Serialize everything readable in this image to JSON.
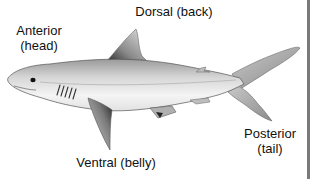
{
  "diagram": {
    "labels": {
      "anterior": {
        "term": "Anterior",
        "descriptor": "(head)"
      },
      "dorsal": {
        "term": "Dorsal",
        "descriptor": "(back)",
        "full": "Dorsal (back)"
      },
      "ventral": {
        "term": "Ventral",
        "descriptor": "(belly)",
        "full": "Ventral (belly)"
      },
      "posterior": {
        "term": "Posterior",
        "descriptor": "(tail)"
      }
    },
    "colors": {
      "background": "#ffffff",
      "text": "#111111",
      "body_light": "#f2f2f2",
      "body_shade": "#a8a8a8",
      "outline": "#555555",
      "border": "#7a7a7a"
    }
  }
}
